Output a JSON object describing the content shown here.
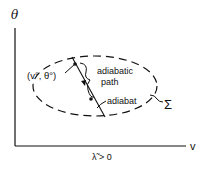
{
  "diagram": {
    "axes": {
      "y_label": "θ",
      "x_label": "v",
      "x_condition": "λ̃ > 0"
    },
    "region_label": "Σ",
    "point_label": "(v°, θ°)",
    "path_label_line1": "adiabatic",
    "path_label_line2": "path",
    "curve_label": "adiabat",
    "colors": {
      "ink": "#111111",
      "background": "#ffffff"
    }
  }
}
